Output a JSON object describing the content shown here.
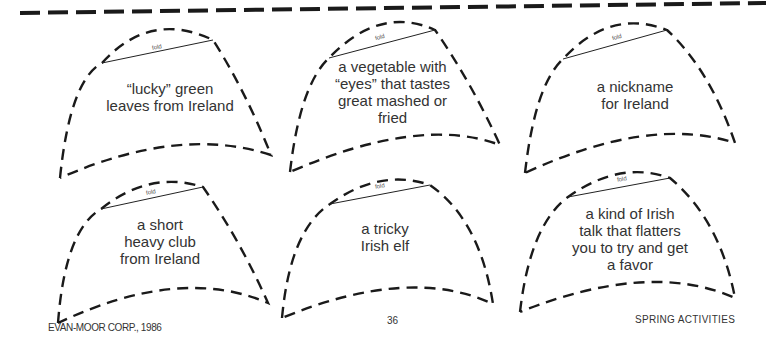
{
  "page": {
    "fold_label": "fold",
    "cards": [
      {
        "text": "“lucky” green\nleaves from Ireland"
      },
      {
        "text": "a vegetable with\n“eyes” that tastes\ngreat mashed or\nfried"
      },
      {
        "text": "a nickname\nfor Ireland"
      },
      {
        "text": "a short\nheavy club\nfrom Ireland"
      },
      {
        "text": "a tricky\nIrish elf"
      },
      {
        "text": "a kind of Irish\ntalk that flatters\nyou to try and get\na favor"
      }
    ],
    "footer": {
      "left": "EVAN-MOOR CORP., 1986",
      "center": "36",
      "right": "SPRING ACTIVITIES"
    }
  }
}
